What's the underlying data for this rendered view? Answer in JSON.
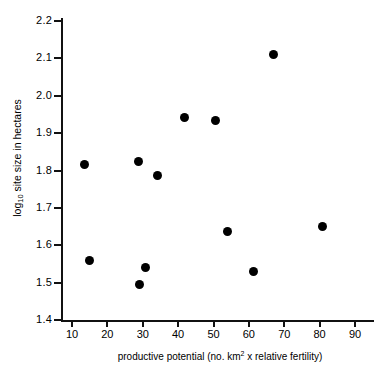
{
  "chart_data": {
    "type": "scatter",
    "title": "",
    "xlabel": "productive potential (no. km2 x relative fertility)",
    "ylabel": "log10 site size in hectares",
    "xlabel_parts": {
      "pre": "productive  potential (no. km",
      "sup": "2",
      "post": " x relative fertility)"
    },
    "ylabel_parts": {
      "pre": "log",
      "sub": "10",
      "post": " site size in hectares"
    },
    "xlim": [
      10,
      90
    ],
    "ylim": [
      1.4,
      2.2
    ],
    "xticks": [
      10,
      20,
      30,
      40,
      50,
      60,
      70,
      80,
      90
    ],
    "yticks": [
      "2.2",
      "2.1",
      "2.0",
      "1.9",
      "1.8",
      "1.7",
      "1.6",
      "1.5",
      "1.4"
    ],
    "ytick_values": [
      2.2,
      2.1,
      2.0,
      1.9,
      1.8,
      1.7,
      1.6,
      1.5,
      1.4
    ],
    "grid": false,
    "legend": false,
    "marker": "filled-circle",
    "marker_color": "#000000",
    "axis_color": "#111111",
    "background": "#ffffff",
    "n_points": 12,
    "points": [
      {
        "x": 13.5,
        "y": 1.815
      },
      {
        "x": 15.0,
        "y": 1.56
      },
      {
        "x": 28.7,
        "y": 1.823
      },
      {
        "x": 29.0,
        "y": 1.495
      },
      {
        "x": 30.8,
        "y": 1.54
      },
      {
        "x": 34.3,
        "y": 1.787
      },
      {
        "x": 41.8,
        "y": 1.943
      },
      {
        "x": 50.6,
        "y": 1.935
      },
      {
        "x": 53.9,
        "y": 1.637
      },
      {
        "x": 61.2,
        "y": 1.53
      },
      {
        "x": 66.9,
        "y": 2.11
      },
      {
        "x": 80.8,
        "y": 1.65
      }
    ]
  }
}
